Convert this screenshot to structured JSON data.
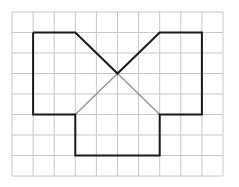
{
  "diagram": {
    "type": "grid-figure",
    "grid": {
      "columns": 10,
      "rows": 8,
      "origin_px": [
        12,
        12
      ],
      "cell_w": 21.1,
      "cell_h": 20.5,
      "line_color": "#c8c8c8"
    },
    "outline": {
      "color": "#1a1a1a",
      "width": 2,
      "points": [
        [
          1,
          1
        ],
        [
          3,
          1
        ],
        [
          5,
          3
        ],
        [
          7,
          1
        ],
        [
          9,
          1
        ],
        [
          9,
          5
        ],
        [
          7,
          5
        ],
        [
          7,
          7
        ],
        [
          3,
          7
        ],
        [
          3,
          5
        ],
        [
          1,
          5
        ],
        [
          1,
          1
        ]
      ]
    },
    "inner_lines": {
      "color": "#999999",
      "width": 1.5,
      "points": [
        [
          3,
          5
        ],
        [
          5,
          3
        ],
        [
          7,
          5
        ]
      ]
    }
  }
}
